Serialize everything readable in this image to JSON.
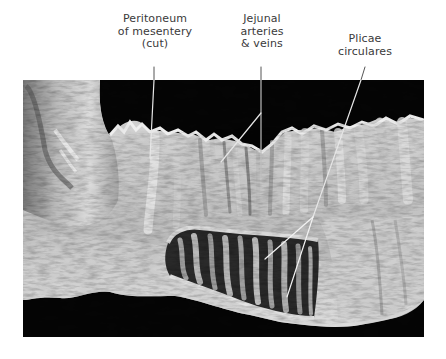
{
  "figure": {
    "image_type": "grayscale anatomical specimen photograph",
    "background_color": "#000000",
    "page_color": "#ffffff",
    "labels": [
      {
        "id": "peritoneum",
        "lines": [
          "Peritoneum",
          "of mesentery",
          "(cut)"
        ],
        "leaders": [
          [
            [
              154,
              67
            ],
            [
              150,
              158
            ]
          ]
        ]
      },
      {
        "id": "jejunal",
        "lines": [
          "Jejunal",
          "arteries",
          "& veins"
        ],
        "leaders": [
          [
            [
              261,
              67
            ],
            [
              261,
              176
            ]
          ],
          [
            [
              261,
              113
            ],
            [
              221,
              162
            ]
          ]
        ]
      },
      {
        "id": "plicae",
        "lines": [
          "Plicae",
          "circulares"
        ],
        "leaders": [
          [
            [
              365,
              67
            ],
            [
              313,
              217
            ]
          ],
          [
            [
              313,
              217
            ],
            [
              265,
              259
            ]
          ],
          [
            [
              313,
              217
            ],
            [
              287,
              297
            ]
          ]
        ]
      }
    ]
  }
}
